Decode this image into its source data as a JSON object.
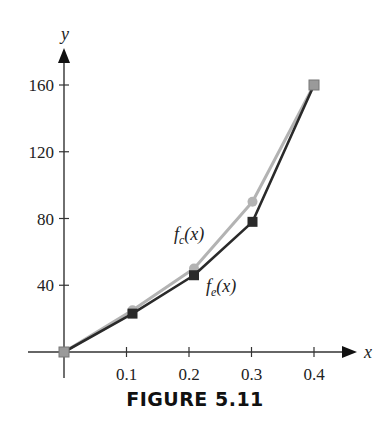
{
  "caption": "FIGURE 5.11",
  "chart_data": {
    "type": "line",
    "title": "",
    "xlabel": "x",
    "ylabel": "y",
    "x": [
      0,
      0.1,
      0.2,
      0.3,
      0.4
    ],
    "xticks": [
      "0.1",
      "0.2",
      "0.3",
      "0.4"
    ],
    "yticks": [
      "40",
      "80",
      "120",
      "160"
    ],
    "xlim": [
      0,
      0.4
    ],
    "ylim": [
      0,
      160
    ],
    "grid": false,
    "series": [
      {
        "name": "f_c(x)",
        "label_main": "f",
        "label_sub": "c",
        "label_tail": "(x)",
        "marker": "circle",
        "color": "#b3b3b3",
        "values": [
          0,
          25,
          50,
          90,
          160
        ]
      },
      {
        "name": "f_e(x)",
        "label_main": "f",
        "label_sub": "e",
        "label_tail": "(x)",
        "marker": "square",
        "color": "#2a2a2a",
        "values": [
          0,
          23,
          46,
          78,
          160
        ]
      }
    ]
  }
}
